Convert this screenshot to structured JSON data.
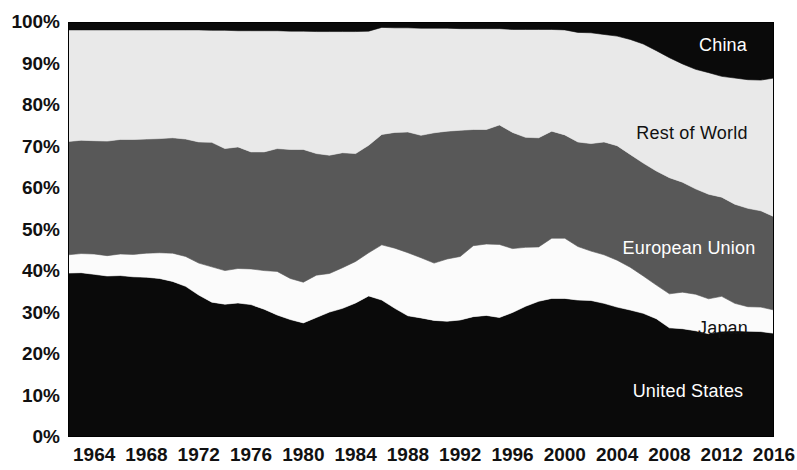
{
  "chart_data": {
    "type": "area",
    "stacked": true,
    "normalized": true,
    "title": "",
    "subtitle": "",
    "xlabel": "",
    "ylabel": "",
    "xlim": [
      1962,
      2016
    ],
    "ylim": [
      0,
      100
    ],
    "grid": false,
    "legend_position": "inline-labels",
    "y_tick_labels": [
      "100%",
      "90%",
      "80%",
      "70%",
      "60%",
      "50%",
      "40%",
      "30%",
      "20%",
      "10%",
      "0%"
    ],
    "y_tick_values": [
      100,
      90,
      80,
      70,
      60,
      50,
      40,
      30,
      20,
      10,
      0
    ],
    "x_tick_labels": [
      "1964",
      "1968",
      "1972",
      "1976",
      "1980",
      "1984",
      "1988",
      "1992",
      "1996",
      "2000",
      "2004",
      "2008",
      "2012",
      "2016"
    ],
    "x_tick_values": [
      1964,
      1968,
      1972,
      1976,
      1980,
      1984,
      1988,
      1992,
      1996,
      2000,
      2004,
      2008,
      2012,
      2016
    ],
    "x": [
      1962,
      1963,
      1964,
      1965,
      1966,
      1967,
      1968,
      1969,
      1970,
      1971,
      1972,
      1973,
      1974,
      1975,
      1976,
      1977,
      1978,
      1979,
      1980,
      1981,
      1982,
      1983,
      1984,
      1985,
      1986,
      1987,
      1988,
      1989,
      1990,
      1991,
      1992,
      1993,
      1994,
      1995,
      1996,
      1997,
      1998,
      1999,
      2000,
      2001,
      2002,
      2003,
      2004,
      2005,
      2006,
      2007,
      2008,
      2009,
      2010,
      2011,
      2012,
      2013,
      2014,
      2015,
      2016
    ],
    "series": [
      {
        "name": "United States",
        "color": "#0a0a0a",
        "label_color": "#ffffff",
        "values": [
          39.5,
          39.6,
          39.2,
          38.8,
          38.9,
          38.6,
          38.5,
          38.2,
          37.5,
          36.3,
          34.2,
          32.5,
          32.0,
          32.3,
          31.9,
          30.8,
          29.4,
          28.3,
          27.5,
          28.8,
          30.1,
          31.0,
          32.3,
          34.0,
          33.0,
          31.0,
          29.2,
          28.7,
          28.1,
          27.9,
          28.2,
          29.0,
          29.3,
          28.8,
          30.0,
          31.5,
          32.7,
          33.4,
          33.4,
          33.0,
          32.9,
          32.2,
          31.3,
          30.6,
          29.8,
          28.5,
          26.3,
          26.1,
          25.6,
          24.9,
          25.5,
          25.6,
          25.5,
          25.4,
          25.0
        ]
      },
      {
        "name": "Japan",
        "color": "#fbfbfb",
        "label_color": "#111111",
        "values": [
          4.4,
          4.6,
          4.9,
          4.9,
          5.2,
          5.4,
          5.8,
          6.2,
          6.8,
          7.2,
          7.7,
          8.5,
          8.1,
          8.3,
          8.6,
          9.3,
          10.5,
          9.9,
          9.8,
          10.2,
          9.3,
          9.8,
          10.0,
          10.4,
          13.3,
          14.5,
          15.2,
          14.5,
          13.8,
          15.0,
          15.3,
          17.1,
          17.2,
          17.6,
          15.4,
          14.2,
          13.1,
          14.5,
          14.5,
          12.9,
          11.9,
          11.7,
          11.3,
          10.3,
          9.0,
          8.1,
          8.2,
          8.8,
          8.8,
          8.4,
          8.4,
          6.6,
          5.9,
          5.9,
          5.6
        ]
      },
      {
        "name": "European Union",
        "color": "#585858",
        "label_color": "#ffffff",
        "values": [
          27.3,
          27.3,
          27.3,
          27.6,
          27.6,
          27.7,
          27.5,
          27.5,
          27.8,
          28.3,
          29.2,
          30.0,
          29.4,
          29.3,
          28.2,
          28.6,
          29.6,
          31.1,
          32.0,
          29.3,
          28.5,
          27.7,
          26.0,
          25.9,
          26.6,
          27.9,
          29.1,
          29.5,
          31.4,
          30.8,
          30.4,
          28.0,
          27.6,
          28.8,
          28.0,
          26.5,
          26.3,
          25.8,
          24.9,
          25.2,
          25.9,
          27.2,
          27.6,
          27.2,
          27.2,
          27.5,
          28.0,
          26.5,
          25.4,
          25.2,
          23.9,
          23.9,
          23.7,
          23.2,
          22.5
        ]
      },
      {
        "name": "Rest of World",
        "color": "#e9e9e9",
        "label_color": "#111111",
        "values": [
          26.9,
          26.6,
          26.7,
          26.8,
          26.4,
          26.4,
          26.3,
          26.2,
          26.0,
          26.3,
          27.0,
          27.0,
          28.5,
          28.0,
          29.2,
          29.2,
          28.4,
          28.5,
          28.5,
          29.4,
          29.8,
          29.2,
          29.4,
          27.5,
          25.8,
          25.2,
          25.1,
          25.8,
          25.2,
          24.8,
          24.5,
          24.3,
          24.3,
          23.2,
          24.8,
          26.0,
          26.1,
          24.5,
          25.3,
          26.4,
          26.7,
          25.9,
          26.4,
          27.7,
          28.7,
          29.0,
          28.9,
          28.5,
          28.8,
          29.3,
          29.1,
          30.4,
          31.0,
          31.5,
          33.4
        ]
      },
      {
        "name": "China",
        "color": "#0a0a0a",
        "label_color": "#ffffff",
        "values": [
          1.9,
          1.9,
          1.9,
          1.9,
          1.9,
          1.9,
          1.9,
          1.9,
          1.9,
          1.9,
          1.9,
          2.0,
          2.0,
          2.1,
          2.1,
          2.1,
          2.1,
          2.2,
          2.2,
          2.3,
          2.3,
          2.3,
          2.3,
          2.2,
          1.3,
          1.4,
          1.4,
          1.5,
          1.5,
          1.5,
          1.6,
          1.6,
          1.6,
          1.6,
          1.8,
          1.8,
          1.8,
          1.8,
          1.9,
          2.5,
          2.6,
          3.0,
          3.4,
          4.2,
          5.3,
          6.9,
          8.6,
          10.1,
          11.4,
          12.2,
          13.1,
          13.5,
          13.9,
          14.0,
          13.5
        ]
      }
    ],
    "series_label_positions": [
      {
        "name": "China",
        "x_px": 723,
        "y_px": 46,
        "anchor": "middle"
      },
      {
        "name": "Rest of World",
        "x_px": 692,
        "y_px": 134,
        "anchor": "middle"
      },
      {
        "name": "European Union",
        "x_px": 689,
        "y_px": 249,
        "anchor": "middle"
      },
      {
        "name": "Japan",
        "x_px": 723,
        "y_px": 329,
        "anchor": "middle"
      },
      {
        "name": "United States",
        "x_px": 688,
        "y_px": 392,
        "anchor": "middle"
      }
    ]
  },
  "plot": {
    "left_px": 68,
    "top_px": 22,
    "width_px": 706,
    "height_px": 415
  }
}
